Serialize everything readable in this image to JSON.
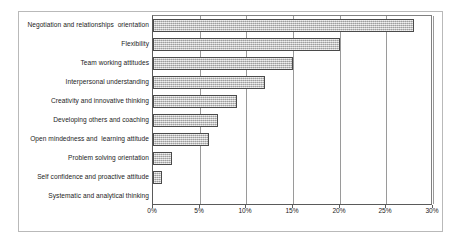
{
  "chart_data": {
    "type": "bar",
    "orientation": "horizontal",
    "title": "",
    "subtitle": "",
    "xlabel": "",
    "ylabel": "",
    "xlim": [
      0,
      30
    ],
    "xtick_labels": [
      "0%",
      "5%",
      "10%",
      "15%",
      "20%",
      "25%",
      "30%"
    ],
    "xticks": [
      0,
      5,
      10,
      15,
      20,
      25,
      30
    ],
    "grid": "vertical",
    "legend": "none",
    "value_suffix": "%",
    "categories": [
      "Negotiation and relationships  orientation",
      "Flexibility",
      "Team working attitudes",
      "Interpersonal understanding",
      "Creativity and innovative thinking",
      "Developing others and coaching",
      "Open mindedness and  learning attitude",
      "Problem solving orientation",
      "Self confidence and proactive attitude",
      "Systematic and analytical thinking"
    ],
    "values": [
      28,
      20,
      15,
      12,
      9,
      7,
      6,
      2,
      1,
      0
    ],
    "series": [
      {
        "name": "Share of responses",
        "values": [
          28,
          20,
          15,
          12,
          9,
          7,
          6,
          2,
          1,
          0
        ]
      }
    ],
    "bar_fill_color": "#c8c8c8",
    "bar_border_color": "#4a4a4a",
    "axis_color": "#5a5a5a",
    "gridline_color": "#9a9a9a",
    "background_color": "#ffffff",
    "frame_color": "#b9b9b9"
  }
}
